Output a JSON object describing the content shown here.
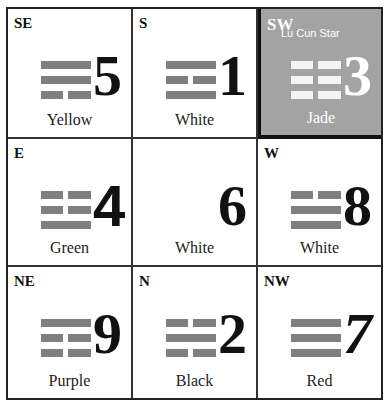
{
  "highlight_color": "#a3a3a3",
  "trigram_color": "#7f7f7f",
  "cells": [
    {
      "direction": "SE",
      "star": "5",
      "color": "Yellow",
      "trigram": [
        "yang",
        "yang",
        "yin"
      ],
      "highlight": false
    },
    {
      "direction": "S",
      "star": "1",
      "color": "White",
      "trigram": [
        "yang",
        "yin",
        "yang"
      ],
      "highlight": false
    },
    {
      "direction": "SW",
      "star": "3",
      "color": "Jade",
      "trigram": [
        "yin",
        "yin",
        "yin"
      ],
      "highlight": true,
      "star_name": "Lu Cun Star"
    },
    {
      "direction": "E",
      "star": "4",
      "color": "Green",
      "trigram": [
        "yin",
        "yin",
        "yang"
      ],
      "highlight": false
    },
    {
      "direction": "",
      "star": "6",
      "color": "White",
      "trigram": [],
      "highlight": false
    },
    {
      "direction": "W",
      "star": "8",
      "color": "White",
      "trigram": [
        "yin",
        "yang",
        "yang"
      ],
      "highlight": false
    },
    {
      "direction": "NE",
      "star": "9",
      "color": "Purple",
      "trigram": [
        "yang",
        "yin",
        "yin"
      ],
      "highlight": false
    },
    {
      "direction": "N",
      "star": "2",
      "color": "Black",
      "trigram": [
        "yin",
        "yang",
        "yin"
      ],
      "highlight": false
    },
    {
      "direction": "NW",
      "star": "7",
      "color": "Red",
      "trigram": [
        "yang",
        "yang",
        "yang"
      ],
      "highlight": false
    }
  ]
}
